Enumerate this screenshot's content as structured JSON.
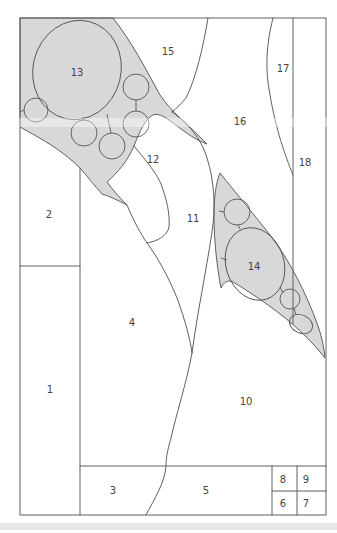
{
  "diagram": {
    "colors": {
      "page": "#ffffff",
      "band_fill": "#d8d8d8",
      "line": "#606060",
      "circle_line": "#555555",
      "label": "#454545",
      "shadow_strip": "#e3e3e3"
    },
    "label_font_size": 10,
    "regions": [
      {
        "id": "region-1",
        "label": "1",
        "x": 50,
        "y": 390
      },
      {
        "id": "region-2",
        "label": "2",
        "x": 49,
        "y": 215
      },
      {
        "id": "region-3",
        "label": "3",
        "x": 113,
        "y": 491
      },
      {
        "id": "region-4",
        "label": "4",
        "x": 132,
        "y": 323
      },
      {
        "id": "region-5",
        "label": "5",
        "x": 206,
        "y": 491
      },
      {
        "id": "region-6",
        "label": "6",
        "x": 283,
        "y": 504
      },
      {
        "id": "region-7",
        "label": "7",
        "x": 306,
        "y": 504
      },
      {
        "id": "region-8",
        "label": "8",
        "x": 283,
        "y": 480
      },
      {
        "id": "region-9",
        "label": "9",
        "x": 306,
        "y": 480
      },
      {
        "id": "region-10",
        "label": "10",
        "x": 246,
        "y": 402
      },
      {
        "id": "region-11",
        "label": "11",
        "x": 193,
        "y": 219
      },
      {
        "id": "region-12",
        "label": "12",
        "x": 153,
        "y": 160
      },
      {
        "id": "region-13",
        "label": "13",
        "x": 77,
        "y": 73
      },
      {
        "id": "region-14",
        "label": "14",
        "x": 254,
        "y": 267
      },
      {
        "id": "region-15",
        "label": "15",
        "x": 168,
        "y": 52
      },
      {
        "id": "region-16",
        "label": "16",
        "x": 240,
        "y": 122
      },
      {
        "id": "region-17",
        "label": "17",
        "x": 283,
        "y": 69
      },
      {
        "id": "region-18",
        "label": "18",
        "x": 305,
        "y": 163
      }
    ]
  }
}
